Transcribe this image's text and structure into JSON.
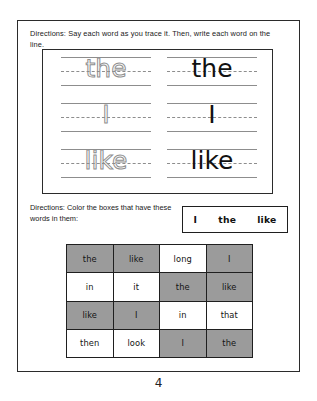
{
  "worksheet": {
    "directions_1": "Directions: Say each word as you trace it. Then, write each word on the line.",
    "directions_2": "Directions: Color the boxes that have these words in them:",
    "page_number": "4",
    "trace_rows": [
      {
        "traced": "the",
        "written": "the"
      },
      {
        "traced": "I",
        "written": "I"
      },
      {
        "traced": "like",
        "written": "like"
      }
    ],
    "word_bank": [
      "I",
      "the",
      "like"
    ],
    "grid": {
      "shaded_color": "#9b9b9b",
      "plain_color": "#ffffff",
      "rows": [
        [
          {
            "word": "the",
            "shaded": true
          },
          {
            "word": "like",
            "shaded": true
          },
          {
            "word": "long",
            "shaded": false
          },
          {
            "word": "I",
            "shaded": true
          }
        ],
        [
          {
            "word": "in",
            "shaded": false
          },
          {
            "word": "it",
            "shaded": false
          },
          {
            "word": "the",
            "shaded": true
          },
          {
            "word": "like",
            "shaded": true
          }
        ],
        [
          {
            "word": "like",
            "shaded": true
          },
          {
            "word": "I",
            "shaded": true
          },
          {
            "word": "in",
            "shaded": false
          },
          {
            "word": "that",
            "shaded": false
          }
        ],
        [
          {
            "word": "then",
            "shaded": false
          },
          {
            "word": "look",
            "shaded": false
          },
          {
            "word": "I",
            "shaded": true
          },
          {
            "word": "the",
            "shaded": true
          }
        ]
      ]
    }
  }
}
